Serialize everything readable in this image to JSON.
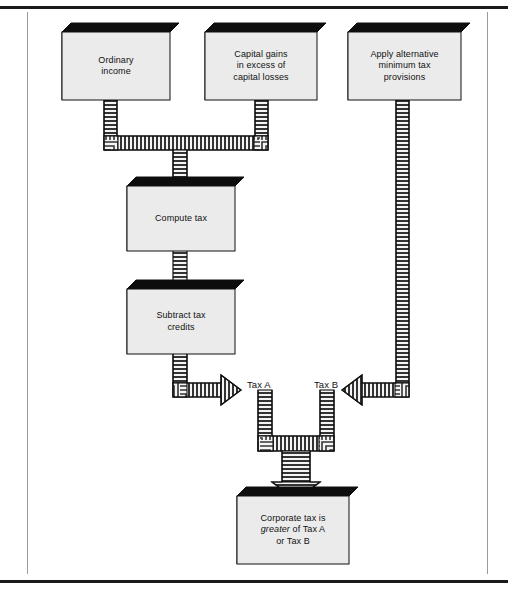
{
  "figure": {
    "style": {
      "box_fill": "#ebebeb",
      "box_edge": "#111111",
      "box_shadow": "#0d0d0d",
      "connector_fill": "#f2f2f2",
      "connector_stripe": "#2b2b2b",
      "rule_color": "#1a1a1a",
      "frame_color": "#9a9a9a",
      "page_bg": "#ffffff"
    }
  },
  "boxes": [
    {
      "id": "ordinary-income",
      "name": "box-ordinary-income",
      "lines": [
        "Ordinary",
        "income"
      ],
      "text": "Ordinary\nincome",
      "x": 62,
      "y": 32,
      "w": 108,
      "h": 68,
      "depth": 9
    },
    {
      "id": "capital-gains",
      "name": "box-capital-gains",
      "lines": [
        "Capital gains",
        "in excess of",
        "capital losses"
      ],
      "text": "Capital gains\nin excess of\ncapital losses",
      "x": 205,
      "y": 32,
      "w": 112,
      "h": 68,
      "depth": 9
    },
    {
      "id": "alternative-minimum-tax",
      "name": "box-alternative-minimum-tax",
      "lines": [
        "Apply alternative",
        "minimum tax",
        "provisions"
      ],
      "text": "Apply alternative\nminimum tax\nprovisions",
      "x": 348,
      "y": 32,
      "w": 113,
      "h": 68,
      "depth": 9
    },
    {
      "id": "compute-tax",
      "name": "box-compute-tax",
      "lines": [
        "Compute tax"
      ],
      "text": "Compute tax",
      "x": 127,
      "y": 186,
      "w": 108,
      "h": 65,
      "depth": 9
    },
    {
      "id": "subtract-tax-credits",
      "name": "box-subtract-tax-credits",
      "lines": [
        "Subtract tax",
        "credits"
      ],
      "text": "Subtract tax\ncredits",
      "x": 127,
      "y": 289,
      "w": 108,
      "h": 65,
      "depth": 9
    },
    {
      "id": "corporate-tax-result",
      "name": "box-corporate-tax-result",
      "lines": [
        "Corporate tax is",
        "greater of Tax A",
        "or Tax B"
      ],
      "text": "Corporate tax is\ngreater of Tax A\nor Tax B",
      "italic_word": "greater",
      "x": 237,
      "y": 496,
      "w": 112,
      "h": 68,
      "depth": 9
    }
  ],
  "labels": [
    {
      "id": "tax-a",
      "name": "label-tax-a",
      "text": "Tax A",
      "x": 247,
      "y": 379
    },
    {
      "id": "tax-b",
      "name": "label-tax-b",
      "text": "Tax B",
      "x": 314,
      "y": 379
    }
  ],
  "connectors": [
    {
      "id": "merge-income-gains",
      "name": "connector-merge-income-to-compute-tax",
      "kind": "merge-down",
      "description": "Ordinary income and Capital gains join then flow down into Compute tax"
    },
    {
      "id": "compute-to-credits",
      "name": "connector-compute-tax-to-subtract-credits",
      "kind": "straight-down",
      "description": "Compute tax flows down into Subtract tax credits"
    },
    {
      "id": "credits-to-tax-a",
      "name": "connector-subtract-credits-to-tax-a",
      "kind": "elbow-right-arrow",
      "description": "Subtract tax credits flows down then right producing Tax A"
    },
    {
      "id": "amt-to-tax-b",
      "name": "connector-amt-to-tax-b",
      "kind": "elbow-left-arrow",
      "description": "Apply alternative minimum tax provisions flows down then left producing Tax B"
    },
    {
      "id": "merge-tax-a-b",
      "name": "connector-merge-tax-a-and-b",
      "kind": "merge-down-arrow",
      "description": "Tax A and Tax B merge and flow down into the Corporate tax result box"
    }
  ],
  "chart_data": {
    "type": "diagram",
    "nodes": [
      "Ordinary income",
      "Capital gains in excess of capital losses",
      "Apply alternative minimum tax provisions",
      "Compute tax",
      "Subtract tax credits",
      "Corporate tax is greater of Tax A or Tax B"
    ],
    "edges": [
      {
        "from": "Ordinary income",
        "to": "Compute tax",
        "label": ""
      },
      {
        "from": "Capital gains in excess of capital losses",
        "to": "Compute tax",
        "label": ""
      },
      {
        "from": "Compute tax",
        "to": "Subtract tax credits",
        "label": ""
      },
      {
        "from": "Subtract tax credits",
        "to": "Corporate tax is greater of Tax A or Tax B",
        "label": "Tax A"
      },
      {
        "from": "Apply alternative minimum tax provisions",
        "to": "Corporate tax is greater of Tax A or Tax B",
        "label": "Tax B"
      }
    ]
  }
}
